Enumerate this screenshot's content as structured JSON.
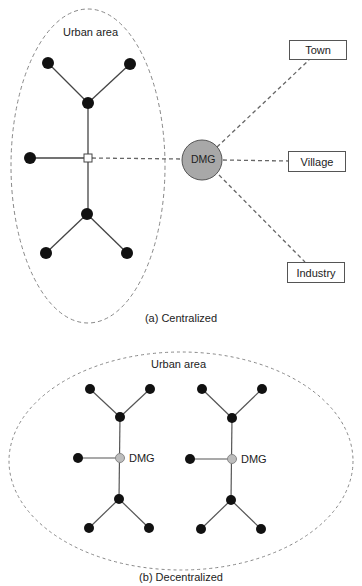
{
  "centralized": {
    "area_label": "Urban area",
    "dmg_label": "DMG",
    "consumers": [
      {
        "label": "Town"
      },
      {
        "label": "Village"
      },
      {
        "label": "Industry"
      }
    ],
    "caption": "(a) Centralized"
  },
  "decentralized": {
    "area_label": "Urban area",
    "dmg_labels": [
      "DMG",
      "DMG"
    ],
    "caption": "(b) Decentralized"
  },
  "colors": {
    "node": "#111111",
    "edge": "#555555",
    "dashed": "#777777",
    "dmg_fill_central": "#a8a8a8",
    "dmg_fill_decentral": "#bdbdbd"
  }
}
